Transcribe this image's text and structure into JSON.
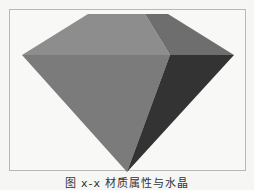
{
  "figure": {
    "caption": "图 x-x 材质属性与水晶",
    "facet_colors": {
      "top_left": "#8d8d8d",
      "top_right": "#6e6e6e",
      "front": "#7b7b7b",
      "right_side": "#333333"
    },
    "frame_border": "#b8b8b8",
    "background": "#f8f8f7"
  }
}
